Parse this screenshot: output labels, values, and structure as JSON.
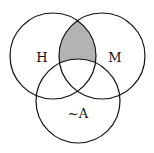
{
  "diagram": {
    "type": "venn",
    "circle_count": 3,
    "circles": [
      {
        "id": "H",
        "label": "H",
        "cx": 53,
        "cy": 56,
        "r": 43,
        "label_x": 42,
        "label_y": 62
      },
      {
        "id": "M",
        "label": "M",
        "cx": 102,
        "cy": 56,
        "r": 43,
        "label_x": 115,
        "label_y": 62
      },
      {
        "id": "notA",
        "label": "~A",
        "cx": 78,
        "cy": 101,
        "r": 42,
        "label_x": 78,
        "label_y": 118
      }
    ],
    "shaded_region": {
      "description": "H ∩ M outside ~A",
      "fill": "#b3b3b3"
    },
    "stroke_color": "#111111",
    "background": "#ffffff"
  }
}
